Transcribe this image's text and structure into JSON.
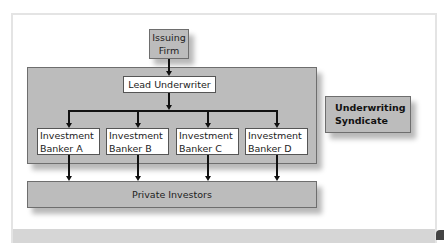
{
  "diagram": {
    "issuing_firm": {
      "line1": "Issuing",
      "line2": "Firm"
    },
    "lead_underwriter": "Lead Underwriter",
    "bankers": [
      {
        "line1": "Investment",
        "line2": "Banker A"
      },
      {
        "line1": "Investment",
        "line2": "Banker B"
      },
      {
        "line1": "Investment",
        "line2": "Banker C"
      },
      {
        "line1": "Investment",
        "line2": "Banker D"
      }
    ],
    "private_investors": "Private Investors",
    "syndicate_label": {
      "line1": "Underwriting",
      "line2": "Syndicate"
    }
  },
  "colors": {
    "gray_box": "#bcbcbc",
    "box_border": "#6e6e6e",
    "white_box": "#ffffff",
    "line": "#111111",
    "frame_border": "#e4e4e4",
    "bottom_band": "#d6d6d6"
  }
}
